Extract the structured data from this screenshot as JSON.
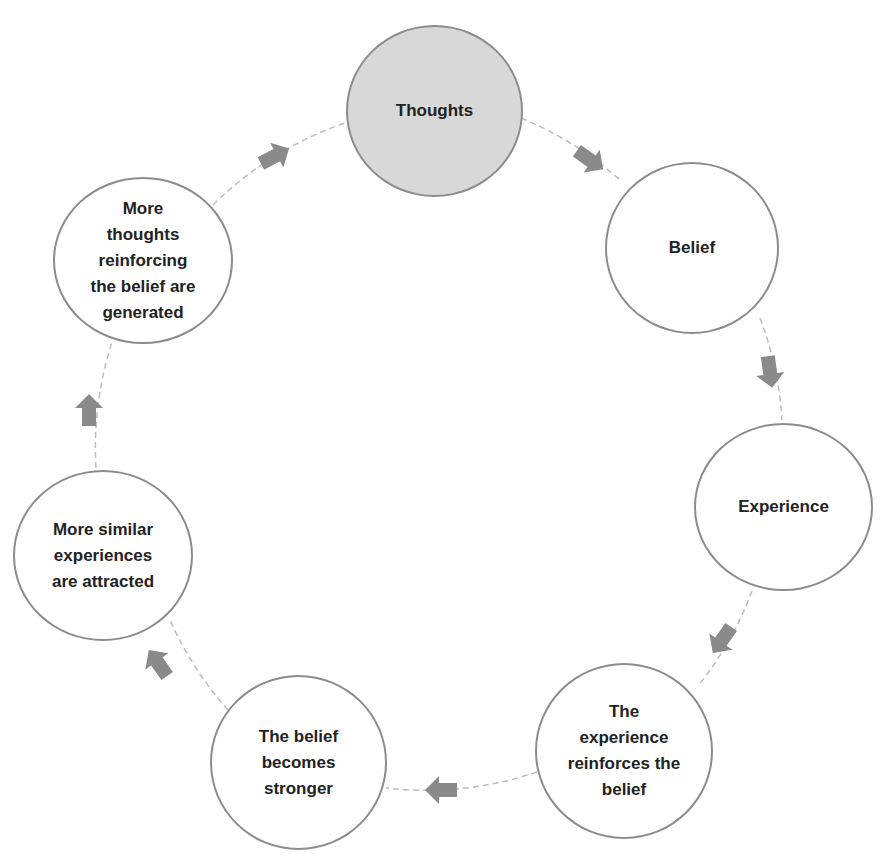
{
  "diagram": {
    "colors": {
      "background": "#ffffff",
      "node_border": "#8c8c8c",
      "node_fill": "#ffffff",
      "highlight_fill": "#d8d8d8",
      "arrow_fill": "#8a8a8a",
      "connector": "#bdbdbd",
      "text": "#222222"
    },
    "nodes": [
      {
        "id": "thoughts",
        "label": "Thoughts",
        "highlight": true
      },
      {
        "id": "belief",
        "label": "Belief",
        "highlight": false
      },
      {
        "id": "experience",
        "label": "Experience",
        "highlight": false
      },
      {
        "id": "reinforces",
        "label": "The\nexperience\nreinforces the\nbelief",
        "highlight": false
      },
      {
        "id": "stronger",
        "label": "The belief\nbecomes\nstronger",
        "highlight": false
      },
      {
        "id": "similar",
        "label": "More similar\nexperiences\nare attracted",
        "highlight": false
      },
      {
        "id": "more-thoughts",
        "label": "More\nthoughts\nreinforcing\nthe belief are\ngenerated",
        "highlight": false
      }
    ],
    "flow": [
      {
        "from": "thoughts",
        "to": "belief"
      },
      {
        "from": "belief",
        "to": "experience"
      },
      {
        "from": "experience",
        "to": "reinforces"
      },
      {
        "from": "reinforces",
        "to": "stronger"
      },
      {
        "from": "stronger",
        "to": "similar"
      },
      {
        "from": "similar",
        "to": "more-thoughts"
      },
      {
        "from": "more-thoughts",
        "to": "thoughts"
      }
    ]
  }
}
